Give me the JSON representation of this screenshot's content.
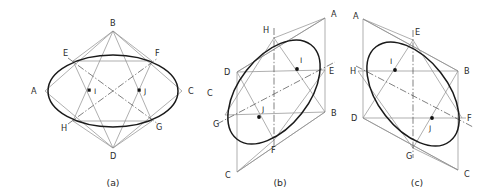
{
  "figure": {
    "panels": [
      {
        "id": "a",
        "caption": "(a)",
        "caption_x": 113,
        "caption_y": 186,
        "ellipse": {
          "cx": 113,
          "cy": 91,
          "rx": 65,
          "ry": 36,
          "rotate": 0
        },
        "rhombus": [
          {
            "label": "A",
            "x": 45,
            "y": 91,
            "lx": 31,
            "ly": 94
          },
          {
            "label": "B",
            "x": 113,
            "y": 31,
            "lx": 110,
            "ly": 26
          },
          {
            "label": "C",
            "x": 182,
            "y": 91,
            "lx": 188,
            "ly": 94
          },
          {
            "label": "D",
            "x": 113,
            "y": 148,
            "lx": 110,
            "ly": 159
          }
        ],
        "tangents": [
          {
            "label": "E",
            "x": 73,
            "y": 61,
            "lx": 63,
            "ly": 56
          },
          {
            "label": "F",
            "x": 152,
            "y": 61,
            "lx": 155,
            "ly": 56
          },
          {
            "label": "G",
            "x": 152,
            "y": 121,
            "lx": 156,
            "ly": 130
          },
          {
            "label": "H",
            "x": 73,
            "y": 121,
            "lx": 63,
            "ly": 131
          }
        ],
        "centers": [
          {
            "label": "I",
            "x": 90,
            "y": 91,
            "lx": 95,
            "ly": 94
          },
          {
            "label": "J",
            "x": 140,
            "y": 91,
            "lx": 145,
            "ly": 94
          }
        ]
      },
      {
        "id": "b",
        "caption": "(b)",
        "caption_x": 75,
        "caption_y": 186,
        "ellipse": {
          "cx": 69,
          "cy": 97,
          "rx": 60,
          "ry": 35,
          "rotate": -52
        },
        "rhombus": [
          {
            "label": "A",
            "x": 120,
            "y": 18,
            "lx": 126,
            "ly": 17
          },
          {
            "label": "B",
            "x": 120,
            "y": 112,
            "lx": 126,
            "ly": 115
          },
          {
            "label": "C",
            "x": 32,
            "y": 172,
            "lx": 22,
            "ly": 175
          },
          {
            "label": "D",
            "x": 32,
            "y": 72,
            "lx": 19,
            "ly": 75
          }
        ],
        "tangents": [
          {
            "label": "H",
            "x": 69,
            "y": 38,
            "lx": 60,
            "ly": 33
          },
          {
            "label": "E",
            "x": 120,
            "y": 70,
            "lx": 125,
            "ly": 73
          },
          {
            "label": "F",
            "x": 69,
            "y": 140,
            "lx": 67,
            "ly": 152
          },
          {
            "label": "G",
            "x": 20,
            "y": 115,
            "lx": 10,
            "ly": 125
          }
        ],
        "centers": [
          {
            "label": "I",
            "x": 92,
            "y": 68,
            "lx": 96,
            "ly": 62
          },
          {
            "label": "J",
            "x": 54,
            "y": 117,
            "lx": 57,
            "ly": 111
          }
        ],
        "minor_axis": {
          "x1": 69,
          "y1": 28,
          "x2": 69,
          "y2": 148
        },
        "major_axis": {
          "x1": 14,
          "y1": 122,
          "x2": 128,
          "y2": 64
        }
      },
      {
        "id": "c",
        "caption": "(c)",
        "caption_x": 72,
        "caption_y": 186,
        "ellipse": {
          "cx": 68,
          "cy": 96,
          "rx": 60,
          "ry": 35,
          "rotate": 52
        },
        "rhombus": [
          {
            "label": "A",
            "x": 18,
            "y": 19,
            "lx": 8,
            "ly": 18
          },
          {
            "label": "B",
            "x": 113,
            "y": 71,
            "lx": 119,
            "ly": 74
          },
          {
            "label": "C",
            "x": 113,
            "y": 170,
            "lx": 119,
            "ly": 173
          },
          {
            "label": "D",
            "x": 18,
            "y": 118,
            "lx": 6,
            "ly": 121
          }
        ],
        "tangents": [
          {
            "label": "E",
            "x": 68,
            "y": 40,
            "lx": 70,
            "ly": 33
          },
          {
            "label": "B_t",
            "x": 113,
            "y": 71,
            "lx": 0,
            "ly": 0
          },
          {
            "label": "F",
            "x": 117,
            "y": 118,
            "lx": 120,
            "ly": 121
          },
          {
            "label": "G",
            "x": 68,
            "y": 148,
            "lx": 62,
            "ly": 158
          },
          {
            "label": "H",
            "x": 18,
            "y": 71,
            "lx": 6,
            "ly": 74
          }
        ],
        "centers": [
          {
            "label": "I",
            "x": 50,
            "y": 69,
            "lx": 46,
            "ly": 62
          },
          {
            "label": "J",
            "x": 87,
            "y": 118,
            "lx": 84,
            "ly": 130
          }
        ],
        "minor_axis": {
          "x1": 68,
          "y1": 30,
          "x2": 68,
          "y2": 158
        },
        "major_axis": {
          "x1": 13,
          "y1": 67,
          "x2": 126,
          "y2": 126
        }
      }
    ]
  },
  "colors": {
    "ellipse_stroke": "#1a1a1a",
    "construction_stroke": "#8d8d8d",
    "centerline_stroke": "#4a4a4a",
    "dot_fill": "#111111",
    "background": "#ffffff",
    "label_text": "#2a2a2a"
  }
}
